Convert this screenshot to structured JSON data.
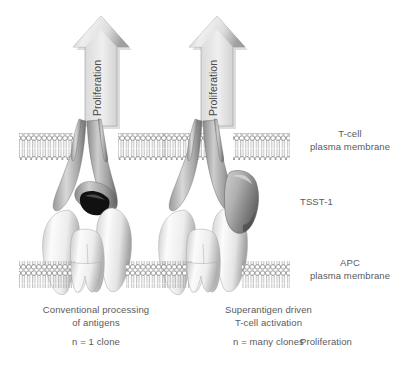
{
  "figure": {
    "background_color": "#ffffff",
    "text_color": "#5a5a5a"
  },
  "arrows": [
    {
      "id": "arrow-left",
      "label": "Proliferation",
      "orientation": "vertical-up",
      "fill": "#d9d9d9"
    },
    {
      "id": "arrow-right",
      "label": "Proliferation",
      "orientation": "vertical-up",
      "fill": "#d9d9d9"
    }
  ],
  "membranes": [
    {
      "id": "t-cell-membrane",
      "name": "T-cell plasma membrane",
      "label_line1": "T-cell",
      "label_line2": "plasma membrane"
    },
    {
      "id": "apc-membrane",
      "name": "APC plasma membrane",
      "label_line1": "APC",
      "label_line2": "plasma membrane"
    }
  ],
  "labels": {
    "tsst1": "TSST-1",
    "proliferation_legend": "Proliferation"
  },
  "panels": [
    {
      "id": "panel-conventional",
      "caption_line1": "Conventional processing",
      "caption_line2": "of antigens",
      "clone_note": "n = 1 clone",
      "has_superantigen": false
    },
    {
      "id": "panel-superantigen",
      "caption_line1": "Superantigen driven",
      "caption_line2": "T-cell activation",
      "clone_note": "n = many clones",
      "has_superantigen": true
    }
  ],
  "colors": {
    "arrow_light": "#efefef",
    "arrow_mid": "#cfcfcf",
    "arrow_dark": "#9e9e9e",
    "tcr_light": "#e8e8e8",
    "tcr_mid": "#b8b8b8",
    "tcr_dark": "#7e7e7e",
    "mhc_light": "#fdfdfd",
    "mhc_mid": "#e2e2e2",
    "mhc_dark": "#a9a9a9",
    "sag_light": "#c9c9c9",
    "sag_dark": "#6e6e6e",
    "membrane_stroke": "#8c8c8c",
    "groove_dark": "#1a1a1a"
  }
}
